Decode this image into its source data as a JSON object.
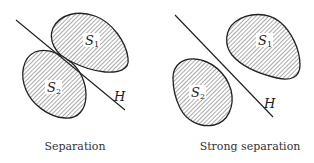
{
  "panels": [
    {
      "caption": "Separation",
      "set1": {
        "name": "S",
        "subscript": "1"
      },
      "set2": {
        "name": "S",
        "subscript": "2"
      },
      "hyperplane": "H"
    },
    {
      "caption": "Strong separation",
      "set1": {
        "name": "S",
        "subscript": "1"
      },
      "set2": {
        "name": "S",
        "subscript": "2"
      },
      "hyperplane": "H"
    }
  ],
  "colors": {
    "stroke": "#222222",
    "hatch": "#555555",
    "background": "#ffffff"
  }
}
